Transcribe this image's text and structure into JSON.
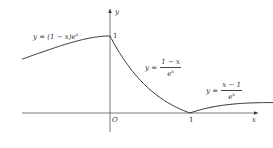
{
  "figure": {
    "axes": {
      "x_label": "x",
      "y_label": "y",
      "origin_label": "O",
      "x_tick_label": "1",
      "y_tick_label": "1"
    },
    "curves": [
      {
        "name": "left",
        "label_lhs": "y = (1 − x)e",
        "label_sup": "x",
        "domain": "x < 0"
      },
      {
        "name": "middle",
        "label_lhs": "y =",
        "label_num": "1 − x",
        "label_den": "e",
        "label_den_sup": "x",
        "domain": "0 ≤ x ≤ 1"
      },
      {
        "name": "right",
        "label_lhs": "y =",
        "label_num": "x − 1",
        "label_den": "e",
        "label_den_sup": "x",
        "domain": "x > 1"
      }
    ],
    "colors": {
      "stroke": "#333333",
      "text": "#333333",
      "background": "#ffffff"
    }
  }
}
